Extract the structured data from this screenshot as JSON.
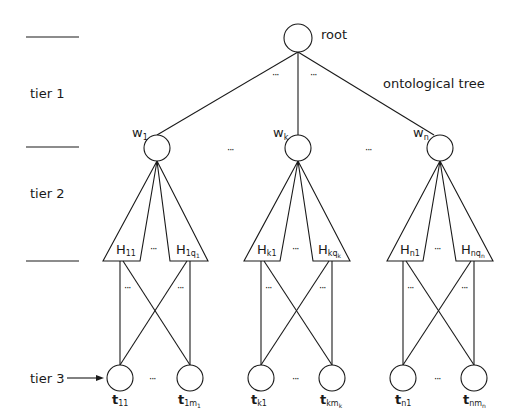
{
  "diagram": {
    "title": "ontological tree",
    "root_label": "root",
    "tiers": [
      {
        "label": "tier 1"
      },
      {
        "label": "tier 2"
      },
      {
        "label": "tier 3"
      }
    ],
    "ellipsis": "···",
    "subtrees": [
      {
        "w": {
          "base": "w",
          "sub": "1"
        },
        "h_left": {
          "base": "H",
          "sub": "11"
        },
        "h_right": {
          "base": "H",
          "sub": "1q",
          "subsub": "1"
        },
        "t_left": {
          "base": "t",
          "sub": "11"
        },
        "t_right": {
          "base": "t",
          "sub": "1m",
          "subsub": "1"
        }
      },
      {
        "w": {
          "base": "w",
          "sub": "k"
        },
        "h_left": {
          "base": "H",
          "sub": "k1"
        },
        "h_right": {
          "base": "H",
          "sub": "kq",
          "subsub": "k"
        },
        "t_left": {
          "base": "t",
          "sub": "k1"
        },
        "t_right": {
          "base": "t",
          "sub": "km",
          "subsub": "k"
        }
      },
      {
        "w": {
          "base": "w",
          "sub": "n"
        },
        "h_left": {
          "base": "H",
          "sub": "n1"
        },
        "h_right": {
          "base": "H",
          "sub": "nq",
          "subsub": "n"
        },
        "t_left": {
          "base": "t",
          "sub": "n1"
        },
        "t_right": {
          "base": "t",
          "sub": "nm",
          "subsub": "n"
        }
      }
    ]
  }
}
